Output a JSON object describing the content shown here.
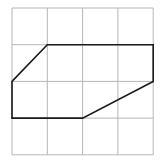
{
  "diagram": {
    "type": "grid-polygon",
    "grid": {
      "cols": 4,
      "rows": 4,
      "origin_px": [
        12,
        8
      ],
      "cell_w_px": 35.3,
      "cell_h_px": 36.7,
      "line_color": "#b5b5b5",
      "line_width": 1
    },
    "polygon": {
      "vertices_grid": [
        [
          1,
          1
        ],
        [
          4,
          1
        ],
        [
          4,
          2
        ],
        [
          2,
          3
        ],
        [
          0,
          3
        ],
        [
          0,
          2
        ]
      ],
      "stroke_color": "#1a1a1a",
      "stroke_width": 1.6,
      "fill": "none"
    }
  }
}
